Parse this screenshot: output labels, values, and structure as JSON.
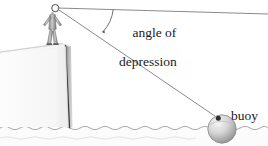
{
  "figure": {
    "labels": {
      "angle_line1": "angle of",
      "angle_line2": "depression",
      "buoy": "buoy"
    },
    "elements": {
      "observer": "person-standing-on-cliff",
      "cliff": "cliff",
      "water": "ocean-water",
      "buoy": "buoy-sphere",
      "horizontal_line": "horizontal-reference-line",
      "sight_line": "line-of-sight",
      "angle_arc": "angle-arc"
    },
    "colors": {
      "line": "#8c8c8c",
      "ink": "#1a1a1a",
      "cliff_face": "#fbfbfb",
      "cliff_edge": "#4a4a4a",
      "water": "#fdfdfd",
      "water_line": "#9a9a9a",
      "buoy_light": "#efefef",
      "buoy_dark": "#9d9d9d"
    },
    "geometry": {
      "eye_point": [
        56,
        8
      ],
      "horizon_end": [
        268,
        14
      ],
      "buoy_point": [
        218,
        118
      ],
      "cliff_top_y": 44,
      "water_line_y": 127
    }
  }
}
